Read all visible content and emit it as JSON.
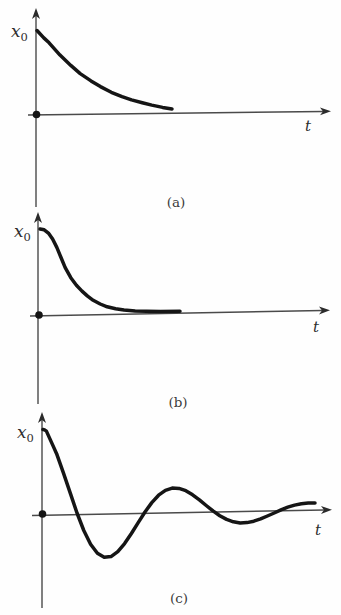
{
  "page": {
    "background": "#fefefe",
    "curve_color": "#151515",
    "axis_color": "#4a4a4a",
    "text_color": "#2e2e2e"
  },
  "chart_data": [
    {
      "id": "a",
      "type": "line",
      "caption": "(a)",
      "x_axis_label": "t",
      "y_axis_label_base": "x",
      "y_axis_label_sub": "0",
      "x_range": [
        0,
        1
      ],
      "y_range": [
        0,
        1
      ],
      "grid": false,
      "legend": false,
      "points": [
        [
          0,
          1
        ],
        [
          0.05,
          0.91
        ],
        [
          0.09,
          0.85
        ],
        [
          0.17,
          0.7
        ],
        [
          0.25,
          0.575
        ],
        [
          0.32,
          0.475
        ],
        [
          0.4,
          0.385
        ],
        [
          0.47,
          0.315
        ],
        [
          0.55,
          0.245
        ],
        [
          0.63,
          0.19
        ],
        [
          0.7,
          0.15
        ],
        [
          0.78,
          0.115
        ],
        [
          0.85,
          0.085
        ],
        [
          0.93,
          0.055
        ],
        [
          1,
          0.035
        ]
      ]
    },
    {
      "id": "b",
      "type": "line",
      "caption": "(b)",
      "x_axis_label": "t",
      "y_axis_label_base": "x",
      "y_axis_label_sub": "0",
      "x_range": [
        0,
        1
      ],
      "y_range": [
        0,
        1
      ],
      "grid": false,
      "legend": false,
      "points": [
        [
          0,
          1
        ],
        [
          0.03,
          0.99
        ],
        [
          0.06,
          0.95
        ],
        [
          0.09,
          0.88
        ],
        [
          0.12,
          0.78
        ],
        [
          0.15,
          0.66
        ],
        [
          0.18,
          0.54
        ],
        [
          0.22,
          0.42
        ],
        [
          0.26,
          0.33
        ],
        [
          0.3,
          0.26
        ],
        [
          0.34,
          0.2
        ],
        [
          0.38,
          0.15
        ],
        [
          0.43,
          0.105
        ],
        [
          0.48,
          0.07
        ],
        [
          0.54,
          0.045
        ],
        [
          0.6,
          0.028
        ],
        [
          0.68,
          0.016
        ],
        [
          0.76,
          0.009
        ],
        [
          0.86,
          0.004
        ],
        [
          1,
          0.002
        ]
      ]
    },
    {
      "id": "c",
      "type": "line",
      "caption": "(c)",
      "x_axis_label": "t",
      "y_axis_label_base": "x",
      "y_axis_label_sub": "0",
      "x_range": [
        0,
        1
      ],
      "y_range": [
        -0.6,
        1
      ],
      "grid": false,
      "legend": false,
      "points": [
        [
          0,
          1
        ],
        [
          0.006,
          0.995
        ],
        [
          0.0125,
          0.98
        ],
        [
          0.025,
          0.89
        ],
        [
          0.0375,
          0.8
        ],
        [
          0.05,
          0.71
        ],
        [
          0.075,
          0.48
        ],
        [
          0.1,
          0.24
        ],
        [
          0.125,
          0
        ],
        [
          0.15,
          -0.21
        ],
        [
          0.175,
          -0.374
        ],
        [
          0.2,
          -0.483
        ],
        [
          0.225,
          -0.532
        ],
        [
          0.25,
          -0.525
        ],
        [
          0.275,
          -0.468
        ],
        [
          0.3,
          -0.373
        ],
        [
          0.325,
          -0.254
        ],
        [
          0.35,
          -0.125
        ],
        [
          0.375,
          0
        ],
        [
          0.4,
          0.11
        ],
        [
          0.425,
          0.197
        ],
        [
          0.45,
          0.254
        ],
        [
          0.475,
          0.279
        ],
        [
          0.5,
          0.275
        ],
        [
          0.525,
          0.246
        ],
        [
          0.55,
          0.196
        ],
        [
          0.575,
          0.134
        ],
        [
          0.6,
          0.066
        ],
        [
          0.625,
          0
        ],
        [
          0.65,
          -0.058
        ],
        [
          0.675,
          -0.103
        ],
        [
          0.7,
          -0.133
        ],
        [
          0.725,
          -0.147
        ],
        [
          0.75,
          -0.145
        ],
        [
          0.775,
          -0.129
        ],
        [
          0.8,
          -0.103
        ],
        [
          0.825,
          -0.07
        ],
        [
          0.85,
          -0.035
        ],
        [
          0.875,
          0
        ],
        [
          0.9,
          0.031
        ],
        [
          0.925,
          0.055
        ],
        [
          0.95,
          0.07
        ],
        [
          0.975,
          0.078
        ],
        [
          1,
          0.077
        ]
      ]
    }
  ]
}
